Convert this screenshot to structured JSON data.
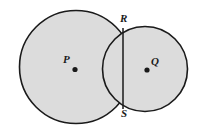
{
  "figure": {
    "background_color": "#ffffff",
    "fill_color": "#dcdcdc",
    "stroke_color": "#1a1a1a",
    "labels": {
      "center_left": "P",
      "center_right": "Q",
      "intersection_top": "R",
      "intersection_bottom": "S"
    },
    "circles": [
      {
        "name": "circle-p",
        "center_label": "P",
        "center_x": 76,
        "center_y": 67,
        "radius": 57
      },
      {
        "name": "circle-q",
        "center_label": "Q",
        "center_x": 145,
        "center_y": 69,
        "radius": 43
      }
    ],
    "points": [
      {
        "name": "P",
        "x": 75,
        "y": 69
      },
      {
        "name": "Q",
        "x": 147,
        "y": 70
      },
      {
        "name": "R",
        "x": 123,
        "y": 28
      },
      {
        "name": "S",
        "x": 123,
        "y": 109
      }
    ],
    "chord": {
      "name": "segment-RS",
      "from": "R",
      "to": "S",
      "x1": 123,
      "y1": 28,
      "x2": 123,
      "y2": 109
    }
  }
}
